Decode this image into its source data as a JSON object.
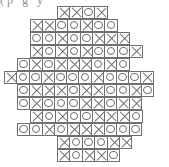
{
  "page": {
    "background_color": "#ffffff",
    "stroke_color": "#6f6f6f",
    "width": 169,
    "height": 167
  },
  "top_text": {
    "visible_fragment": "(p  g                        y",
    "note": "clipped descender text along the very top edge"
  },
  "legend": {
    "symbols": [
      {
        "key": "O",
        "name": "circle-symbol",
        "glyph": "O"
      },
      {
        "key": "X",
        "name": "cross-symbol",
        "glyph": "X"
      }
    ]
  },
  "chart_data": {
    "type": "heatmap",
    "xlabel": "",
    "ylabel": "",
    "cell_size_px": 13.4,
    "rows": 12,
    "max_columns": 12,
    "categories": [
      "X",
      "O"
    ],
    "grid": [
      {
        "row": 1,
        "left_px": 57,
        "top_px": 5.5,
        "cells": [
          "X",
          "X",
          "O",
          "X"
        ]
      },
      {
        "row": 2,
        "left_px": 30,
        "top_px": 18.5,
        "cells": [
          "X",
          "X",
          "O",
          "O",
          "X",
          "O",
          "O"
        ]
      },
      {
        "row": 3,
        "left_px": 30,
        "top_px": 31.5,
        "cells": [
          "O",
          "O",
          "X",
          "O",
          "O",
          "X",
          "X",
          "X"
        ]
      },
      {
        "row": 4,
        "left_px": 30,
        "top_px": 44.5,
        "cells": [
          "X",
          "O",
          "X",
          "O",
          "X",
          "O",
          "O",
          "O",
          "X"
        ]
      },
      {
        "row": 5,
        "left_px": 17,
        "top_px": 57.5,
        "cells": [
          "O",
          "X",
          "O",
          "X",
          "X",
          "X",
          "O",
          "X",
          "O"
        ]
      },
      {
        "row": 6,
        "left_px": 4,
        "top_px": 70.5,
        "cells": [
          "X",
          "O",
          "O",
          "X",
          "O",
          "O",
          "O",
          "X",
          "O",
          "O",
          "O",
          "X"
        ]
      },
      {
        "row": 7,
        "left_px": 17,
        "top_px": 83.5,
        "cells": [
          "O",
          "X",
          "X",
          "X",
          "O",
          "X",
          "X",
          "O",
          "O",
          "X",
          "O"
        ]
      },
      {
        "row": 8,
        "left_px": 17,
        "top_px": 96.5,
        "cells": [
          "O",
          "X",
          "O",
          "O",
          "O",
          "X",
          "X",
          "O",
          "X",
          "X"
        ]
      },
      {
        "row": 9,
        "left_px": 30,
        "top_px": 109.5,
        "cells": [
          "X",
          "O",
          "X",
          "O",
          "O",
          "X",
          "X",
          "X",
          "O"
        ]
      },
      {
        "row": 10,
        "left_px": 17,
        "top_px": 122.5,
        "cells": [
          "O",
          "O",
          "X",
          "O",
          "X",
          "X",
          "X",
          "O",
          "O",
          "O"
        ]
      },
      {
        "row": 11,
        "left_px": 57,
        "top_px": 135.5,
        "cells": [
          "X",
          "O",
          "O",
          "O",
          "X",
          "X"
        ]
      },
      {
        "row": 12,
        "left_px": 57,
        "top_px": 148.5,
        "cells": [
          "X",
          "O",
          "X",
          "X",
          "O"
        ]
      }
    ]
  }
}
